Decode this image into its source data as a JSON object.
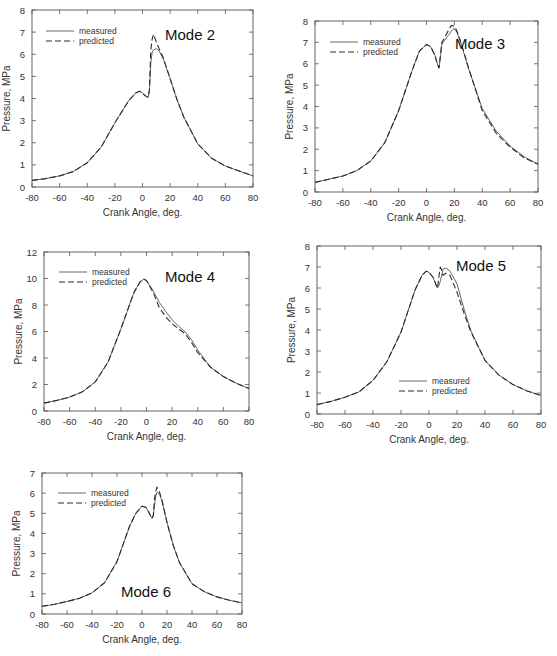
{
  "figure": {
    "panels_count": 5
  },
  "chart_data": [
    {
      "id": "mode2",
      "type": "line",
      "title": "Mode 2",
      "xlabel": "Crank Angle, deg.",
      "ylabel": "Pressure, MPa",
      "xlim": [
        -80,
        80
      ],
      "ylim": [
        0,
        8
      ],
      "xticks": [
        -80,
        -60,
        -40,
        -20,
        0,
        20,
        40,
        60,
        80
      ],
      "yticks": [
        0,
        1,
        2,
        3,
        4,
        5,
        6,
        7,
        8
      ],
      "grid": false,
      "legend": [
        "measured",
        "predicted"
      ],
      "legend_position": "upper-left",
      "plot_box": {
        "left": 32,
        "top": 10,
        "right": 253,
        "bottom": 187
      },
      "title_pos": {
        "x": 190,
        "y": 40
      },
      "legend_pos": {
        "x": 46,
        "y": 31
      },
      "series": [
        {
          "name": "measured",
          "style": "solid",
          "x": [
            -80,
            -70,
            -60,
            -50,
            -40,
            -30,
            -20,
            -10,
            -5,
            -2,
            0,
            2,
            4,
            5,
            6,
            7,
            8,
            10,
            12,
            15,
            20,
            25,
            30,
            40,
            50,
            60,
            70,
            80
          ],
          "y": [
            0.3,
            0.38,
            0.5,
            0.7,
            1.1,
            1.8,
            2.9,
            3.9,
            4.25,
            4.33,
            4.25,
            4.12,
            4.05,
            4.3,
            5.6,
            6.1,
            6.2,
            6.25,
            6.15,
            5.8,
            4.9,
            3.95,
            3.15,
            1.95,
            1.3,
            0.95,
            0.72,
            0.5
          ]
        },
        {
          "name": "predicted",
          "style": "dashed",
          "x": [
            -80,
            -70,
            -60,
            -50,
            -40,
            -30,
            -20,
            -10,
            -5,
            -2,
            0,
            2,
            4,
            5,
            6,
            7,
            8,
            10,
            12,
            15,
            20,
            25,
            30,
            40,
            50,
            60,
            70,
            80
          ],
          "y": [
            0.3,
            0.38,
            0.5,
            0.7,
            1.1,
            1.8,
            2.9,
            3.9,
            4.25,
            4.33,
            4.25,
            4.12,
            4.05,
            4.4,
            6.2,
            6.7,
            6.9,
            6.55,
            6.25,
            5.85,
            4.9,
            3.95,
            3.15,
            1.95,
            1.3,
            0.95,
            0.72,
            0.5
          ]
        }
      ]
    },
    {
      "id": "mode3",
      "type": "line",
      "title": "Mode 3",
      "xlabel": "Crank Angle, deg.",
      "ylabel": "Pressure, MPa",
      "xlim": [
        -80,
        80
      ],
      "ylim": [
        0,
        8
      ],
      "xticks": [
        -80,
        -60,
        -40,
        -20,
        0,
        20,
        40,
        60,
        80
      ],
      "yticks": [
        0,
        1,
        2,
        3,
        4,
        5,
        6,
        7,
        8
      ],
      "grid": false,
      "legend": [
        "measured",
        "predicted"
      ],
      "legend_position": "upper-left",
      "plot_box": {
        "left": 315,
        "top": 21,
        "right": 538,
        "bottom": 192
      },
      "title_pos": {
        "x": 480,
        "y": 49
      },
      "legend_pos": {
        "x": 330,
        "y": 42
      },
      "series": [
        {
          "name": "measured",
          "style": "solid",
          "x": [
            -80,
            -70,
            -60,
            -50,
            -40,
            -30,
            -20,
            -10,
            -5,
            0,
            3,
            6,
            8,
            9,
            10,
            11,
            12,
            14,
            16,
            18,
            20,
            22,
            25,
            30,
            40,
            50,
            60,
            70,
            80
          ],
          "y": [
            0.45,
            0.6,
            0.75,
            1.0,
            1.45,
            2.3,
            3.8,
            5.75,
            6.6,
            6.9,
            6.8,
            6.4,
            5.95,
            5.8,
            6.3,
            6.9,
            7.0,
            7.2,
            7.35,
            7.55,
            7.65,
            7.45,
            6.9,
            5.8,
            3.9,
            2.85,
            2.15,
            1.65,
            1.3
          ]
        },
        {
          "name": "predicted",
          "style": "dashed",
          "x": [
            -80,
            -70,
            -60,
            -50,
            -40,
            -30,
            -20,
            -10,
            -5,
            0,
            3,
            6,
            8,
            9,
            10,
            11,
            12,
            14,
            16,
            18,
            20,
            22,
            25,
            30,
            40,
            50,
            60,
            70,
            80
          ],
          "y": [
            0.45,
            0.6,
            0.75,
            1.0,
            1.45,
            2.3,
            3.8,
            5.75,
            6.6,
            6.9,
            6.8,
            6.4,
            5.95,
            5.8,
            6.4,
            7.0,
            7.1,
            7.35,
            7.6,
            7.8,
            7.75,
            7.5,
            6.95,
            5.85,
            3.8,
            2.75,
            2.1,
            1.6,
            1.3
          ]
        }
      ]
    },
    {
      "id": "mode4",
      "type": "line",
      "title": "Mode 4",
      "xlabel": "Crank Angle, deg.",
      "ylabel": "Pressure, MPa",
      "xlim": [
        -80,
        80
      ],
      "ylim": [
        0,
        12
      ],
      "xticks": [
        -80,
        -60,
        -40,
        -20,
        0,
        20,
        40,
        60,
        80
      ],
      "yticks": [
        0,
        2,
        4,
        6,
        8,
        10,
        12
      ],
      "grid": false,
      "legend": [
        "measured",
        "predicted"
      ],
      "legend_position": "upper-left",
      "plot_box": {
        "left": 44,
        "top": 252,
        "right": 249,
        "bottom": 411
      },
      "title_pos": {
        "x": 190,
        "y": 282
      },
      "legend_pos": {
        "x": 59,
        "y": 272
      },
      "series": [
        {
          "name": "measured",
          "style": "solid",
          "x": [
            -80,
            -70,
            -60,
            -50,
            -40,
            -30,
            -20,
            -10,
            -5,
            -2,
            0,
            5,
            10,
            15,
            20,
            25,
            30,
            35,
            40,
            50,
            60,
            70,
            80
          ],
          "y": [
            0.6,
            0.8,
            1.05,
            1.45,
            2.2,
            3.7,
            6.2,
            8.9,
            9.75,
            9.95,
            9.85,
            9.1,
            8.2,
            7.5,
            6.9,
            6.4,
            6.0,
            5.4,
            4.6,
            3.3,
            2.6,
            2.1,
            1.7
          ]
        },
        {
          "name": "predicted",
          "style": "dashed",
          "x": [
            -80,
            -70,
            -60,
            -50,
            -40,
            -30,
            -20,
            -10,
            -5,
            -2,
            0,
            5,
            10,
            15,
            20,
            25,
            30,
            35,
            40,
            50,
            60,
            70,
            80
          ],
          "y": [
            0.6,
            0.8,
            1.05,
            1.45,
            2.2,
            3.7,
            6.2,
            8.9,
            9.75,
            9.95,
            9.85,
            9.0,
            7.8,
            7.1,
            6.6,
            6.2,
            5.85,
            5.2,
            4.4,
            3.3,
            2.6,
            2.1,
            1.7
          ]
        }
      ]
    },
    {
      "id": "mode5",
      "type": "line",
      "title": "Mode 5",
      "xlabel": "Crank Angle, deg.",
      "ylabel": "Pressure, MPa",
      "xlim": [
        -80,
        80
      ],
      "ylim": [
        0,
        8
      ],
      "xticks": [
        -80,
        -60,
        -40,
        -20,
        0,
        20,
        40,
        60,
        80
      ],
      "yticks": [
        0,
        1,
        2,
        3,
        4,
        5,
        6,
        7,
        8
      ],
      "grid": false,
      "legend": [
        "measured",
        "predicted"
      ],
      "legend_position": "lower-center",
      "plot_box": {
        "left": 317,
        "top": 246,
        "right": 541,
        "bottom": 414
      },
      "title_pos": {
        "x": 481,
        "y": 271
      },
      "legend_pos": {
        "x": 399,
        "y": 381
      },
      "series": [
        {
          "name": "measured",
          "style": "solid",
          "x": [
            -80,
            -70,
            -60,
            -50,
            -40,
            -30,
            -20,
            -10,
            -5,
            -2,
            0,
            3,
            5,
            6,
            7,
            8,
            9,
            10,
            12,
            15,
            20,
            25,
            30,
            40,
            50,
            60,
            70,
            80
          ],
          "y": [
            0.45,
            0.6,
            0.8,
            1.05,
            1.6,
            2.5,
            3.9,
            5.9,
            6.6,
            6.8,
            6.75,
            6.5,
            6.15,
            6.0,
            6.1,
            6.3,
            6.6,
            6.9,
            6.95,
            6.8,
            6.2,
            5.0,
            3.95,
            2.55,
            1.85,
            1.4,
            1.1,
            0.88
          ]
        },
        {
          "name": "predicted",
          "style": "dashed",
          "x": [
            -80,
            -70,
            -60,
            -50,
            -40,
            -30,
            -20,
            -10,
            -5,
            -2,
            0,
            3,
            5,
            6,
            7,
            8,
            9,
            10,
            12,
            15,
            20,
            25,
            30,
            40,
            50,
            60,
            70,
            80
          ],
          "y": [
            0.45,
            0.6,
            0.8,
            1.05,
            1.6,
            2.5,
            3.9,
            5.9,
            6.6,
            6.8,
            6.75,
            6.5,
            6.15,
            6.0,
            6.5,
            7.0,
            6.85,
            6.6,
            6.7,
            6.6,
            5.8,
            4.8,
            3.9,
            2.55,
            1.85,
            1.4,
            1.1,
            0.88
          ]
        }
      ]
    },
    {
      "id": "mode6",
      "type": "line",
      "title": "Mode 6",
      "xlabel": "Crank Angle, deg.",
      "ylabel": "Pressure, MPa",
      "xlim": [
        -80,
        80
      ],
      "ylim": [
        0,
        7
      ],
      "xticks": [
        -80,
        -60,
        -40,
        -20,
        0,
        20,
        40,
        60,
        80
      ],
      "yticks": [
        0,
        1,
        2,
        3,
        4,
        5,
        6,
        7
      ],
      "grid": false,
      "legend": [
        "measured",
        "predicted"
      ],
      "legend_position": "upper-left",
      "plot_box": {
        "left": 42,
        "top": 473,
        "right": 242,
        "bottom": 614
      },
      "title_pos": {
        "x": 146,
        "y": 597
      },
      "legend_pos": {
        "x": 58,
        "y": 493
      },
      "series": [
        {
          "name": "measured",
          "style": "solid",
          "x": [
            -80,
            -70,
            -60,
            -50,
            -40,
            -30,
            -20,
            -10,
            -5,
            0,
            3,
            5,
            7,
            8,
            9,
            10,
            11,
            12,
            14,
            16,
            20,
            25,
            30,
            40,
            50,
            60,
            70,
            80
          ],
          "y": [
            0.38,
            0.48,
            0.62,
            0.78,
            1.05,
            1.55,
            2.6,
            4.35,
            5.0,
            5.35,
            5.3,
            5.1,
            4.85,
            4.75,
            4.85,
            5.4,
            5.85,
            6.05,
            5.95,
            5.6,
            4.55,
            3.4,
            2.55,
            1.5,
            1.1,
            0.85,
            0.68,
            0.55
          ]
        },
        {
          "name": "predicted",
          "style": "dashed",
          "x": [
            -80,
            -70,
            -60,
            -50,
            -40,
            -30,
            -20,
            -10,
            -5,
            0,
            3,
            5,
            7,
            8,
            9,
            10,
            11,
            12,
            14,
            16,
            20,
            25,
            30,
            40,
            50,
            60,
            70,
            80
          ],
          "y": [
            0.38,
            0.48,
            0.62,
            0.78,
            1.05,
            1.55,
            2.6,
            4.35,
            5.0,
            5.35,
            5.3,
            5.1,
            4.85,
            4.75,
            4.9,
            5.7,
            6.1,
            6.3,
            6.05,
            5.65,
            4.55,
            3.4,
            2.55,
            1.5,
            1.1,
            0.85,
            0.68,
            0.55
          ]
        }
      ]
    }
  ]
}
